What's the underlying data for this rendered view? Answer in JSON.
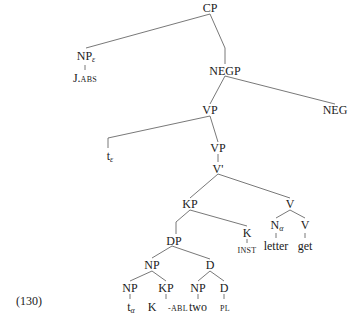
{
  "example_number": "(130)",
  "nodes": {
    "cp": {
      "label": "CP"
    },
    "np_eps": {
      "label": "NP",
      "sub": "ε"
    },
    "j_abs": {
      "label": "J.",
      "sc": "ABS"
    },
    "negp": {
      "label": "NEGP"
    },
    "vp1": {
      "label": "VP"
    },
    "neg": {
      "label": "NEG"
    },
    "t_eps": {
      "label": "t",
      "sub": "ε"
    },
    "vp2": {
      "label": "VP"
    },
    "vbar": {
      "label": "V'"
    },
    "kp1": {
      "label": "KP"
    },
    "v1": {
      "label": "V"
    },
    "dp": {
      "label": "DP"
    },
    "k1": {
      "label": "K"
    },
    "inst": {
      "sc": "INST"
    },
    "n_alpha": {
      "label": "N",
      "sub": "α"
    },
    "v2": {
      "label": "V"
    },
    "letter": {
      "label": "letter"
    },
    "get": {
      "label": "get"
    },
    "np2": {
      "label": "NP"
    },
    "d1": {
      "label": "D"
    },
    "np3": {
      "label": "NP"
    },
    "kp2": {
      "label": "KP"
    },
    "np4": {
      "label": "NP"
    },
    "d2": {
      "label": "D"
    },
    "t_alpha": {
      "label": "t",
      "sub": "α"
    },
    "k2": {
      "label": "K"
    },
    "abl": {
      "sc": "-ABL"
    },
    "two": {
      "label": "two"
    },
    "pl": {
      "sc": "PL"
    }
  }
}
